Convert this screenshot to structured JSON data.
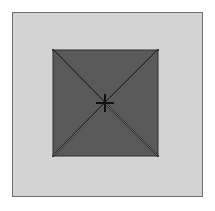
{
  "figure": {
    "colors": {
      "background": "#d3d3d3",
      "frame_border": "#6e6e6e",
      "pyramid_fill": "#5a5a5a",
      "edge_line": "#2e2e2e",
      "highlight_line": "#9a9a9a",
      "apex_mark": "#111111"
    },
    "pyramid": {
      "corners": [
        [
          53,
          50
        ],
        [
          158,
          50
        ],
        [
          158,
          156
        ],
        [
          53,
          156
        ]
      ],
      "apex": [
        105,
        103
      ]
    }
  }
}
